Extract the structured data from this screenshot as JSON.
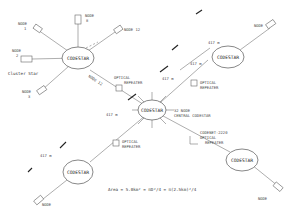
{
  "diagram": {
    "type": "star network topology",
    "hubs": [
      {
        "id": "hub-top-left",
        "label": "CODESTAR"
      },
      {
        "id": "hub-central",
        "label": "CODESTAR"
      },
      {
        "id": "hub-top-right",
        "label": "CODESTAR"
      },
      {
        "id": "hub-bottom-left",
        "label": "CODESTAR"
      },
      {
        "id": "hub-bottom-right",
        "label": "CODESTAR"
      }
    ],
    "nodes": {
      "node1": "NODE\n1",
      "node2": "NODE\n2",
      "node3": "NODE\n3",
      "node8": "NODE\n8",
      "node12": "NODE 12",
      "node_top_right": "NODE",
      "node_bottom_left": "NODE",
      "node_bottom_right": "NODE"
    },
    "labels": {
      "cluster_star": "Cluster Star",
      "node_label_12": "NODE 12",
      "central_line1": "32 NODE",
      "central_line2": "CENTRAL CODESTAR",
      "repeater_codenet": "CODENET-2220",
      "optical": "OPTICAL",
      "repeater": "REPEATER",
      "dist1": "417 m",
      "dist2": "417 m",
      "dist3": "417 m",
      "dist4": "417 m",
      "dist5": "417 m",
      "area_formula": "Area = 5.0km² = πD²/4 = π(2.5km)²/4"
    },
    "node1_l1": "NODE",
    "node1_l2": "1",
    "node2_l1": "NODE",
    "node2_l2": "2",
    "node3_l1": "NODE",
    "node3_l2": "3",
    "node8_l1": "NODE",
    "node8_l2": "8",
    "node12": "NODE 12",
    "node_generic": "NODE",
    "hub_label": "CODESTAR"
  }
}
